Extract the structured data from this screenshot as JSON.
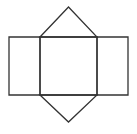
{
  "canvas": {
    "width": 137,
    "height": 134,
    "background_color": "#ffffff"
  },
  "diagram": {
    "kind": "triangular-prism-net",
    "stroke_color": "#333333",
    "stroke_width": 1.3,
    "fill": "none",
    "shapes": [
      {
        "name": "left-rectangle-face",
        "type": "polygon",
        "points": [
          [
            9,
            37
          ],
          [
            40,
            37
          ],
          [
            40,
            95
          ],
          [
            9,
            95
          ]
        ]
      },
      {
        "name": "middle-rectangle-face",
        "type": "polygon",
        "points": [
          [
            40,
            37
          ],
          [
            97,
            37
          ],
          [
            97,
            95
          ],
          [
            40,
            95
          ]
        ]
      },
      {
        "name": "right-rectangle-face",
        "type": "polygon",
        "points": [
          [
            97,
            37
          ],
          [
            128,
            37
          ],
          [
            128,
            95
          ],
          [
            97,
            95
          ]
        ]
      },
      {
        "name": "top-triangle-face",
        "type": "polygon",
        "points": [
          [
            40,
            37
          ],
          [
            68.5,
            7
          ],
          [
            97,
            37
          ]
        ]
      },
      {
        "name": "bottom-triangle-face",
        "type": "polygon",
        "points": [
          [
            40,
            95
          ],
          [
            68.5,
            122
          ],
          [
            97,
            95
          ]
        ]
      }
    ]
  }
}
